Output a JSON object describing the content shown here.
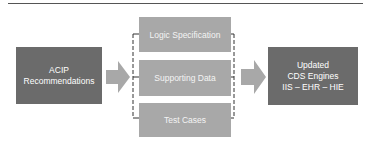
{
  "diagram": {
    "source": {
      "lines": [
        "ACIP",
        "Recommendations"
      ]
    },
    "components": [
      {
        "label": "Logic Specification"
      },
      {
        "label": "Supporting Data"
      },
      {
        "label": "Test Cases"
      }
    ],
    "target": {
      "lines": [
        "Updated",
        "CDS Engines",
        "IIS – EHR – HIE"
      ]
    },
    "colors": {
      "dark_box": "#6b6b6b",
      "light_box": "#a8a8a8",
      "arrow": "#a8a8a8",
      "dashed_bracket": "#333333",
      "top_rule": "#555555"
    }
  }
}
